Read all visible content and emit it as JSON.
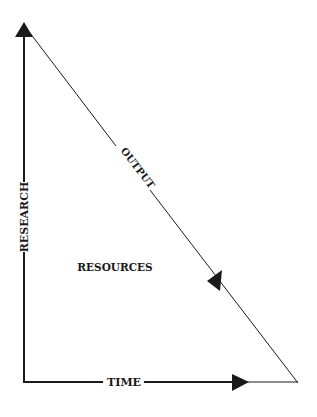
{
  "diagram": {
    "type": "triangle-flow",
    "colors": {
      "ink": "#1a1a1a",
      "background": "#ffffff"
    },
    "labels": {
      "vertical_axis": "RESEARCH",
      "horizontal_axis": "TIME",
      "diagonal": "OUTPUT",
      "interior": "RESOURCES"
    },
    "arrows": [
      {
        "name": "research-arrow",
        "direction": "up"
      },
      {
        "name": "time-arrow",
        "direction": "right"
      },
      {
        "name": "output-arrow",
        "direction": "down-right"
      }
    ]
  }
}
